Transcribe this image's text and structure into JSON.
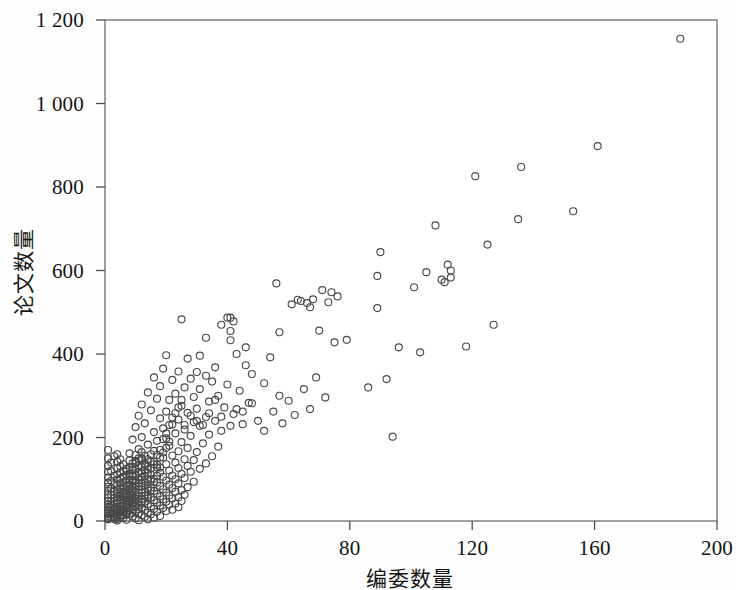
{
  "figure": {
    "background": "#fefefe",
    "frame_color": "#6b6b6b",
    "marker_color": "#4a4a4a"
  },
  "chart_data": {
    "type": "scatter",
    "title": "",
    "xlabel": "编委数量",
    "ylabel": "论文数量",
    "xlim": [
      0,
      200
    ],
    "ylim": [
      0,
      1200
    ],
    "xticks": [
      0,
      40,
      80,
      120,
      160,
      200
    ],
    "yticks": [
      0,
      200,
      400,
      600,
      800,
      1000,
      1200
    ],
    "xtick_labels": [
      "0",
      "40",
      "80",
      "120",
      "160",
      "200"
    ],
    "ytick_labels": [
      "0",
      "200",
      "400",
      "600",
      "800",
      "1 000",
      "1 200"
    ],
    "grid": false,
    "legend": null,
    "marker": "open-circle",
    "marker_size": 7,
    "n_points": 431,
    "points": [
      [
        188,
        1155
      ],
      [
        161,
        898
      ],
      [
        136,
        848
      ],
      [
        121,
        826
      ],
      [
        153,
        742
      ],
      [
        135,
        723
      ],
      [
        108,
        708
      ],
      [
        125,
        662
      ],
      [
        90,
        644
      ],
      [
        112,
        614
      ],
      [
        113,
        583
      ],
      [
        89,
        587
      ],
      [
        56,
        569
      ],
      [
        96,
        416
      ],
      [
        71,
        553
      ],
      [
        74,
        548
      ],
      [
        76,
        538
      ],
      [
        68,
        531
      ],
      [
        110,
        578
      ],
      [
        111,
        572
      ],
      [
        64,
        527
      ],
      [
        61,
        519
      ],
      [
        89,
        510
      ],
      [
        40,
        487
      ],
      [
        25,
        483
      ],
      [
        42,
        478
      ],
      [
        38,
        470
      ],
      [
        57,
        452
      ],
      [
        33,
        439
      ],
      [
        41,
        433
      ],
      [
        75,
        428
      ],
      [
        70,
        456
      ],
      [
        46,
        416
      ],
      [
        43,
        400
      ],
      [
        20,
        397
      ],
      [
        31,
        396
      ],
      [
        54,
        392
      ],
      [
        27,
        389
      ],
      [
        46,
        373
      ],
      [
        36,
        368
      ],
      [
        19,
        365
      ],
      [
        24,
        358
      ],
      [
        30,
        357
      ],
      [
        48,
        352
      ],
      [
        33,
        348
      ],
      [
        16,
        344
      ],
      [
        28,
        341
      ],
      [
        22,
        338
      ],
      [
        35,
        334
      ],
      [
        52,
        330
      ],
      [
        40,
        327
      ],
      [
        18,
        323
      ],
      [
        26,
        320
      ],
      [
        31,
        316
      ],
      [
        44,
        312
      ],
      [
        14,
        308
      ],
      [
        23,
        305
      ],
      [
        37,
        300
      ],
      [
        29,
        297
      ],
      [
        17,
        293
      ],
      [
        21,
        290
      ],
      [
        34,
        286
      ],
      [
        47,
        283
      ],
      [
        12,
        279
      ],
      [
        25,
        276
      ],
      [
        39,
        272
      ],
      [
        30,
        269
      ],
      [
        15,
        265
      ],
      [
        20,
        262
      ],
      [
        27,
        259
      ],
      [
        42,
        256
      ],
      [
        11,
        252
      ],
      [
        33,
        249
      ],
      [
        18,
        246
      ],
      [
        24,
        243
      ],
      [
        36,
        240
      ],
      [
        29,
        237
      ],
      [
        13,
        234
      ],
      [
        22,
        231
      ],
      [
        31,
        228
      ],
      [
        45,
        262
      ],
      [
        10,
        225
      ],
      [
        19,
        222
      ],
      [
        26,
        219
      ],
      [
        38,
        216
      ],
      [
        16,
        213
      ],
      [
        23,
        210
      ],
      [
        34,
        207
      ],
      [
        28,
        204
      ],
      [
        12,
        201
      ],
      [
        20,
        198
      ],
      [
        41,
        228
      ],
      [
        9,
        195
      ],
      [
        17,
        192
      ],
      [
        25,
        189
      ],
      [
        32,
        186
      ],
      [
        14,
        183
      ],
      [
        21,
        180
      ],
      [
        37,
        178
      ],
      [
        27,
        175
      ],
      [
        11,
        172
      ],
      [
        18,
        170
      ],
      [
        24,
        167
      ],
      [
        30,
        165
      ],
      [
        8,
        162
      ],
      [
        15,
        160
      ],
      [
        22,
        157
      ],
      [
        35,
        155
      ],
      [
        19,
        152
      ],
      [
        12,
        150
      ],
      [
        26,
        148
      ],
      [
        29,
        146
      ],
      [
        10,
        144
      ],
      [
        16,
        142
      ],
      [
        23,
        140
      ],
      [
        33,
        138
      ],
      [
        20,
        136
      ],
      [
        13,
        134
      ],
      [
        27,
        132
      ],
      [
        9,
        130
      ],
      [
        17,
        128
      ],
      [
        24,
        127
      ],
      [
        31,
        125
      ],
      [
        14,
        123
      ],
      [
        21,
        121
      ],
      [
        7,
        119
      ],
      [
        28,
        118
      ],
      [
        18,
        116
      ],
      [
        11,
        114
      ],
      [
        25,
        113
      ],
      [
        15,
        111
      ],
      [
        22,
        109
      ],
      [
        8,
        107
      ],
      [
        19,
        106
      ],
      [
        12,
        104
      ],
      [
        26,
        103
      ],
      [
        16,
        101
      ],
      [
        23,
        100
      ],
      [
        9,
        98
      ],
      [
        20,
        97
      ],
      [
        13,
        95
      ],
      [
        29,
        94
      ],
      [
        17,
        92
      ],
      [
        10,
        91
      ],
      [
        24,
        90
      ],
      [
        14,
        88
      ],
      [
        21,
        87
      ],
      [
        6,
        85
      ],
      [
        18,
        84
      ],
      [
        11,
        83
      ],
      [
        27,
        81
      ],
      [
        15,
        80
      ],
      [
        22,
        79
      ],
      [
        8,
        77
      ],
      [
        19,
        76
      ],
      [
        12,
        75
      ],
      [
        25,
        74
      ],
      [
        16,
        72
      ],
      [
        9,
        71
      ],
      [
        23,
        70
      ],
      [
        13,
        69
      ],
      [
        20,
        68
      ],
      [
        7,
        66
      ],
      [
        17,
        65
      ],
      [
        10,
        64
      ],
      [
        26,
        63
      ],
      [
        14,
        62
      ],
      [
        21,
        61
      ],
      [
        5,
        60
      ],
      [
        18,
        59
      ],
      [
        11,
        58
      ],
      [
        24,
        57
      ],
      [
        15,
        56
      ],
      [
        8,
        55
      ],
      [
        22,
        54
      ],
      [
        12,
        53
      ],
      [
        19,
        52
      ],
      [
        6,
        51
      ],
      [
        16,
        50
      ],
      [
        9,
        49
      ],
      [
        25,
        48
      ],
      [
        13,
        47
      ],
      [
        20,
        46
      ],
      [
        4,
        45
      ],
      [
        17,
        44
      ],
      [
        10,
        43
      ],
      [
        23,
        42
      ],
      [
        14,
        41
      ],
      [
        7,
        40
      ],
      [
        21,
        39
      ],
      [
        11,
        38
      ],
      [
        18,
        37
      ],
      [
        5,
        36
      ],
      [
        15,
        35
      ],
      [
        8,
        34
      ],
      [
        24,
        33
      ],
      [
        12,
        32
      ],
      [
        19,
        31
      ],
      [
        3,
        30
      ],
      [
        16,
        29
      ],
      [
        9,
        28
      ],
      [
        22,
        27
      ],
      [
        13,
        26
      ],
      [
        6,
        25
      ],
      [
        20,
        24
      ],
      [
        10,
        23
      ],
      [
        17,
        22
      ],
      [
        4,
        21
      ],
      [
        14,
        20
      ],
      [
        7,
        19
      ],
      [
        11,
        18
      ],
      [
        2,
        17
      ],
      [
        15,
        16
      ],
      [
        8,
        15
      ],
      [
        12,
        14
      ],
      [
        5,
        13
      ],
      [
        18,
        12
      ],
      [
        9,
        11
      ],
      [
        13,
        10
      ],
      [
        3,
        9
      ],
      [
        16,
        8
      ],
      [
        6,
        7
      ],
      [
        10,
        6
      ],
      [
        1,
        5
      ],
      [
        14,
        4
      ],
      [
        7,
        3
      ],
      [
        11,
        2
      ],
      [
        4,
        1
      ],
      [
        2,
        140
      ],
      [
        3,
        155
      ],
      [
        2,
        120
      ],
      [
        3,
        108
      ],
      [
        2,
        96
      ],
      [
        3,
        88
      ],
      [
        2,
        78
      ],
      [
        3,
        70
      ],
      [
        2,
        62
      ],
      [
        3,
        55
      ],
      [
        2,
        48
      ],
      [
        3,
        42
      ],
      [
        2,
        36
      ],
      [
        3,
        30
      ],
      [
        2,
        25
      ],
      [
        3,
        20
      ],
      [
        2,
        16
      ],
      [
        3,
        12
      ],
      [
        2,
        8
      ],
      [
        3,
        5
      ],
      [
        1,
        170
      ],
      [
        1,
        150
      ],
      [
        1,
        132
      ],
      [
        1,
        118
      ],
      [
        1,
        104
      ],
      [
        1,
        92
      ],
      [
        1,
        82
      ],
      [
        1,
        72
      ],
      [
        1,
        63
      ],
      [
        1,
        55
      ],
      [
        1,
        47
      ],
      [
        1,
        40
      ],
      [
        1,
        34
      ],
      [
        1,
        28
      ],
      [
        1,
        22
      ],
      [
        1,
        17
      ],
      [
        1,
        12
      ],
      [
        1,
        8
      ],
      [
        1,
        4
      ],
      [
        4,
        160
      ],
      [
        4,
        142
      ],
      [
        4,
        126
      ],
      [
        4,
        112
      ],
      [
        4,
        99
      ],
      [
        4,
        87
      ],
      [
        4,
        76
      ],
      [
        4,
        66
      ],
      [
        4,
        57
      ],
      [
        4,
        49
      ],
      [
        4,
        41
      ],
      [
        4,
        34
      ],
      [
        4,
        27
      ],
      [
        4,
        21
      ],
      [
        4,
        15
      ],
      [
        4,
        10
      ],
      [
        4,
        5
      ],
      [
        5,
        148
      ],
      [
        5,
        131
      ],
      [
        5,
        116
      ],
      [
        5,
        102
      ],
      [
        5,
        90
      ],
      [
        5,
        79
      ],
      [
        5,
        69
      ],
      [
        5,
        59
      ],
      [
        5,
        50
      ],
      [
        5,
        42
      ],
      [
        5,
        34
      ],
      [
        5,
        27
      ],
      [
        5,
        20
      ],
      [
        5,
        14
      ],
      [
        5,
        8
      ],
      [
        6,
        136
      ],
      [
        6,
        120
      ],
      [
        6,
        106
      ],
      [
        6,
        93
      ],
      [
        6,
        81
      ],
      [
        6,
        70
      ],
      [
        6,
        60
      ],
      [
        6,
        51
      ],
      [
        6,
        43
      ],
      [
        6,
        35
      ],
      [
        6,
        28
      ],
      [
        6,
        21
      ],
      [
        6,
        14
      ],
      [
        7,
        125
      ],
      [
        7,
        110
      ],
      [
        7,
        97
      ],
      [
        7,
        85
      ],
      [
        7,
        74
      ],
      [
        7,
        64
      ],
      [
        7,
        55
      ],
      [
        7,
        46
      ],
      [
        7,
        38
      ],
      [
        7,
        30
      ],
      [
        7,
        23
      ],
      [
        7,
        16
      ],
      [
        8,
        145
      ],
      [
        8,
        128
      ],
      [
        8,
        113
      ],
      [
        8,
        99
      ],
      [
        8,
        87
      ],
      [
        8,
        76
      ],
      [
        8,
        66
      ],
      [
        8,
        57
      ],
      [
        8,
        48
      ],
      [
        8,
        40
      ],
      [
        8,
        32
      ],
      [
        8,
        25
      ],
      [
        9,
        138
      ],
      [
        9,
        122
      ],
      [
        9,
        108
      ],
      [
        9,
        95
      ],
      [
        9,
        83
      ],
      [
        9,
        72
      ],
      [
        9,
        62
      ],
      [
        9,
        53
      ],
      [
        9,
        44
      ],
      [
        9,
        36
      ],
      [
        9,
        19
      ],
      [
        10,
        158
      ],
      [
        10,
        140
      ],
      [
        10,
        124
      ],
      [
        10,
        110
      ],
      [
        10,
        97
      ],
      [
        10,
        85
      ],
      [
        10,
        74
      ],
      [
        10,
        53
      ],
      [
        10,
        34
      ],
      [
        11,
        150
      ],
      [
        11,
        133
      ],
      [
        11,
        118
      ],
      [
        11,
        104
      ],
      [
        11,
        91
      ],
      [
        11,
        68
      ],
      [
        11,
        47
      ],
      [
        11,
        28
      ],
      [
        12,
        165
      ],
      [
        12,
        146
      ],
      [
        12,
        129
      ],
      [
        12,
        114
      ],
      [
        12,
        90
      ],
      [
        12,
        67
      ],
      [
        12,
        45
      ],
      [
        13,
        156
      ],
      [
        13,
        138
      ],
      [
        13,
        122
      ],
      [
        13,
        107
      ],
      [
        13,
        84
      ],
      [
        13,
        60
      ],
      [
        14,
        148
      ],
      [
        14,
        131
      ],
      [
        14,
        115
      ],
      [
        14,
        100
      ],
      [
        14,
        77
      ],
      [
        14,
        54
      ],
      [
        15,
        142
      ],
      [
        15,
        126
      ],
      [
        15,
        99
      ],
      [
        15,
        73
      ],
      [
        16,
        168
      ],
      [
        16,
        136
      ],
      [
        16,
        94
      ],
      [
        17,
        158
      ],
      [
        17,
        135
      ],
      [
        17,
        108
      ],
      [
        18,
        152
      ],
      [
        18,
        128
      ],
      [
        19,
        196
      ],
      [
        19,
        164
      ],
      [
        20,
        210
      ],
      [
        20,
        175
      ],
      [
        21,
        230
      ],
      [
        21,
        190
      ],
      [
        22,
        248
      ],
      [
        23,
        258
      ],
      [
        24,
        272
      ],
      [
        25,
        290
      ],
      [
        26,
        230
      ],
      [
        28,
        252
      ],
      [
        30,
        240
      ],
      [
        32,
        230
      ],
      [
        34,
        258
      ],
      [
        36,
        290
      ],
      [
        38,
        250
      ],
      [
        41,
        487
      ],
      [
        41,
        455
      ],
      [
        43,
        268
      ],
      [
        45,
        232
      ],
      [
        48,
        282
      ],
      [
        50,
        240
      ],
      [
        52,
        216
      ],
      [
        55,
        262
      ],
      [
        57,
        300
      ],
      [
        58,
        234
      ],
      [
        60,
        288
      ],
      [
        62,
        254
      ],
      [
        65,
        316
      ],
      [
        67,
        268
      ],
      [
        69,
        344
      ],
      [
        72,
        296
      ],
      [
        63,
        530
      ],
      [
        66,
        522
      ],
      [
        73,
        524
      ],
      [
        67,
        512
      ],
      [
        79,
        434
      ],
      [
        94,
        202
      ],
      [
        86,
        320
      ],
      [
        92,
        340
      ],
      [
        103,
        404
      ],
      [
        118,
        418
      ],
      [
        127,
        470
      ],
      [
        105,
        596
      ],
      [
        101,
        560
      ],
      [
        113,
        600
      ]
    ]
  },
  "axes": {
    "x_title": "编委数量",
    "y_title": "论文数量"
  }
}
